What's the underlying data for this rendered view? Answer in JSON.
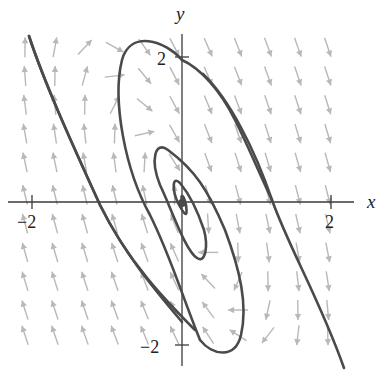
{
  "chart_data": {
    "type": "phase_portrait",
    "title": "",
    "xlabel": "x",
    "ylabel": "y",
    "xlim": [
      -2.2,
      2.2
    ],
    "ylim": [
      -2.2,
      2.2
    ],
    "grid": false,
    "legend": null,
    "x_ticks": [
      {
        "value": -2,
        "label": "−2"
      },
      {
        "value": 2,
        "label": "2"
      }
    ],
    "y_ticks": [
      {
        "value": 2,
        "label": "2"
      },
      {
        "value": -2,
        "label": "−2"
      }
    ],
    "equilibrium": {
      "x": 0,
      "y": 0,
      "type": "stable spiral"
    },
    "direction_field": {
      "description": "gray arrows on an 11x11 grid; upper-right arrows point down-right, lower-left arrows point up-left",
      "approx_system": {
        "dx": "x + y",
        "dy": "-4x - 2y"
      },
      "grid_x": [
        -2.1,
        -1.7,
        -1.3,
        -0.9,
        -0.5,
        -0.1,
        0.35,
        0.75,
        1.15,
        1.55,
        1.95
      ],
      "grid_y": [
        2.15,
        1.75,
        1.35,
        0.95,
        0.55,
        0.1,
        -0.3,
        -0.7,
        -1.1,
        -1.5,
        -1.85
      ]
    },
    "trajectories": [
      {
        "name": "outer",
        "description": "enters top-left near (-2.0, 2.2), crosses x-axis near (-1.2, 0), continues across the plane, exits bottom-right near (2.2, -2.2)"
      },
      {
        "name": "spiral-large",
        "description": "large loop peaking near (-0.6, 2.3), crossing y-axis at ~1.9 and ~-1.7, x-axis near 1.2 and -0.35"
      },
      {
        "name": "spiral-mid",
        "description": "loop around origin, reaching ~0.8 up, ~-0.65 down"
      },
      {
        "name": "spiral-small",
        "description": "tight loops converging to the origin"
      }
    ]
  },
  "axes": {
    "x_label": "x",
    "y_label": "y",
    "x_tick_neg": "−2",
    "x_tick_pos": "2",
    "y_tick_pos": "2",
    "y_tick_neg": "−2"
  },
  "colors": {
    "trajectory": "#4a4a4a",
    "field_arrow": "#b8b8b8",
    "axis": "#3a3a3a"
  }
}
